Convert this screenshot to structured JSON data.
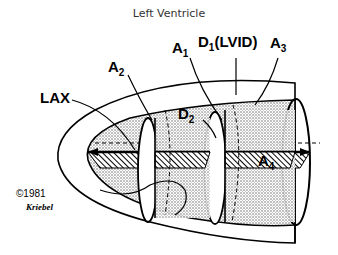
{
  "title": "Left Ventricle",
  "labels": {
    "lax": "LAX",
    "a2_main": "A",
    "a2_sub": "2",
    "a1_main": "A",
    "a1_sub": "1",
    "d1_main": "D",
    "d1_sub": "1",
    "d1_paren": "(LVID)",
    "a3_main": "A",
    "a3_sub": "3",
    "d2_main": "D",
    "d2_sub": "2",
    "a4_main": "A",
    "a4_sub": "4"
  },
  "copyright": {
    "text": "©1981",
    "signature": "Kriebel"
  },
  "colors": {
    "line": "#000000",
    "stipple": "#bdbdbd",
    "background": "#ffffff"
  }
}
